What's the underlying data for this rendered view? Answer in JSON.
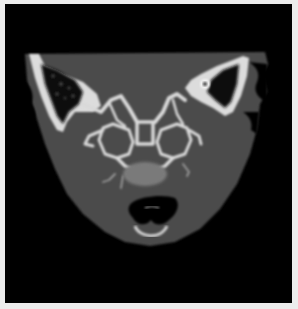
{
  "image": {
    "kind": "CT scan",
    "view": "coronal slice, skull base",
    "colors": {
      "frame": "#ececec",
      "background": "#000000",
      "soft_tissue": "#4a4a4a",
      "bone": "#e8e8e8",
      "air": "#050505"
    }
  }
}
